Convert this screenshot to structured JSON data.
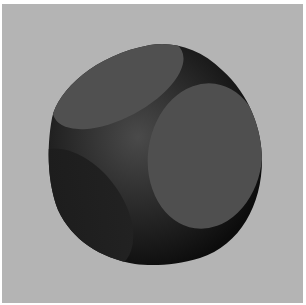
{
  "image": {
    "subject": "Rendered 3D solid: intersection of a sphere and a cube (rounded cube with three visible flat circular faces)",
    "background_color": "#b4b4b4",
    "border_color": "#ffffff",
    "object_colors": {
      "body_dark": "#141414",
      "body_mid": "#3a3a3a",
      "face_top": "#505050",
      "face_right": "#4e4e4e",
      "face_left": "#1c1c1c"
    }
  }
}
